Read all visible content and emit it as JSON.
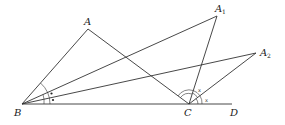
{
  "diagram": {
    "title": "",
    "points": {
      "A": {
        "label": "A",
        "sub": "",
        "x": 88,
        "y": 29
      },
      "A1": {
        "label": "A",
        "sub": "1",
        "x": 217,
        "y": 16
      },
      "A2": {
        "label": "A",
        "sub": "2",
        "x": 256,
        "y": 53
      },
      "B": {
        "label": "B",
        "sub": "",
        "x": 22,
        "y": 104
      },
      "C": {
        "label": "C",
        "sub": "",
        "x": 189,
        "y": 104
      },
      "D": {
        "label": "D",
        "sub": "",
        "x": 232,
        "y": 104
      }
    },
    "segments": [
      "AB",
      "AC",
      "BA1",
      "CA1",
      "BA2",
      "CA2",
      "BD"
    ],
    "angle_marks": {
      "B_dots": "•",
      "C_x1": "x",
      "C_x2": "x"
    },
    "colors": {
      "line": "#333333",
      "background": "#ffffff"
    }
  }
}
